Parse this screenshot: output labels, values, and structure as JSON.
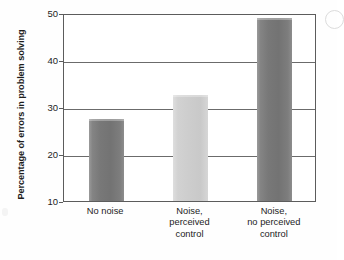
{
  "chart_data": {
    "type": "bar",
    "title": "",
    "subtitle": "",
    "xlabel": "",
    "ylabel": "Percentage of errors in problem solving",
    "categories": [
      "No noise",
      "Noise, perceived control",
      "Noise, no perceived control"
    ],
    "category_lines": [
      [
        "No noise"
      ],
      [
        "Noise,",
        "perceived",
        "control"
      ],
      [
        "Noise,",
        "no perceived",
        "control"
      ]
    ],
    "values": [
      27.5,
      32.5,
      48.9
    ],
    "ylim": [
      10,
      50
    ],
    "yticks": [
      10,
      20,
      30,
      40,
      50
    ],
    "ytick_labels": [
      "10",
      "20",
      "30",
      "40",
      "50"
    ],
    "grid": "horizontal",
    "legend": "none",
    "bar_colors": [
      "#7a7a7a",
      "#cfcfcf",
      "#7a7a7a"
    ],
    "annotations": []
  },
  "axes": {
    "frame_color": "#5c5c5c",
    "gridline_color": "#6b6b6b",
    "background": "#ffffff"
  },
  "figure": {
    "background": "#fefefe",
    "text_color": "#1d1d1d"
  }
}
